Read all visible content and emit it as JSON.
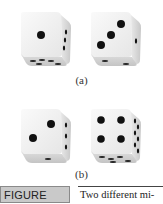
{
  "figure": {
    "label_prefix": "FIGURE ",
    "label_number": "18.9",
    "caption_text": "Two different mi-"
  },
  "panels": [
    {
      "caption": "(a)",
      "dice": [
        {
          "front_face": 1,
          "right_face_pips": 3,
          "bottom_face_pips": 5
        },
        {
          "front_face": 3,
          "right_face_pips": 1,
          "bottom_face_pips": 2
        }
      ]
    },
    {
      "caption": "(b)",
      "dice": [
        {
          "front_face": 2,
          "right_face_pips": 3,
          "bottom_face_pips": 1
        },
        {
          "front_face": 4,
          "right_face_pips": 6,
          "bottom_face_pips": 5
        }
      ]
    }
  ],
  "colors": {
    "label_bg": "#c9c9c9",
    "label_border": "#8a8a8a",
    "pip": "#111111",
    "die_face": "#f4f4f4",
    "die_shade": "#d6d6d6"
  }
}
